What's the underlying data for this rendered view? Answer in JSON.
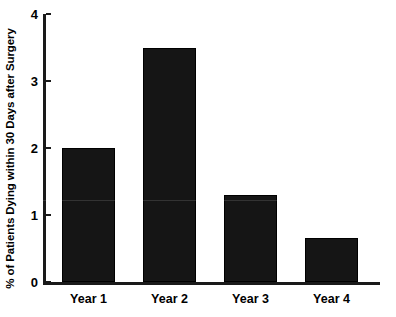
{
  "chart_data": {
    "type": "bar",
    "title": "",
    "subtitle": "",
    "xlabel": "",
    "ylabel": "% of Patients Dying within 30 Days after Surgery",
    "categories": [
      "Year 1",
      "Year 2",
      "Year 3",
      "Year 4"
    ],
    "values": [
      2.0,
      3.5,
      1.3,
      0.65
    ],
    "series": [
      {
        "name": "% of Patients Dying within 30 Days after Surgery",
        "values": [
          2.0,
          3.5,
          1.3,
          0.65
        ],
        "color": "#151515"
      }
    ],
    "ylim": [
      0,
      4
    ],
    "yticks": [
      0,
      1,
      2,
      3,
      4
    ],
    "ytick_labels": [
      "0",
      "1",
      "2",
      "3",
      "4"
    ],
    "grid": false,
    "legend": false,
    "legend_position": "none",
    "bar_color": "#151515",
    "axis_color": "#1a1a1a",
    "background": "#ffffff",
    "annotations": []
  }
}
